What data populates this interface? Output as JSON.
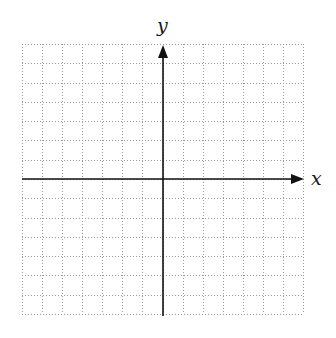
{
  "diagram": {
    "type": "cartesian-coordinate-grid",
    "grid": {
      "columns": 14,
      "rows": 14,
      "left": 22,
      "right": 303,
      "top": 44,
      "bottom": 314,
      "line_style": "dotted",
      "line_color": "#9a9a9a"
    },
    "axes": {
      "color": "#111111",
      "origin": {
        "x": 163,
        "y": 179
      },
      "x_axis": {
        "label": "x",
        "start": 22,
        "end": 304,
        "arrow": "right"
      },
      "y_axis": {
        "label": "y",
        "start": 316,
        "end": 45,
        "arrow": "up"
      }
    }
  }
}
